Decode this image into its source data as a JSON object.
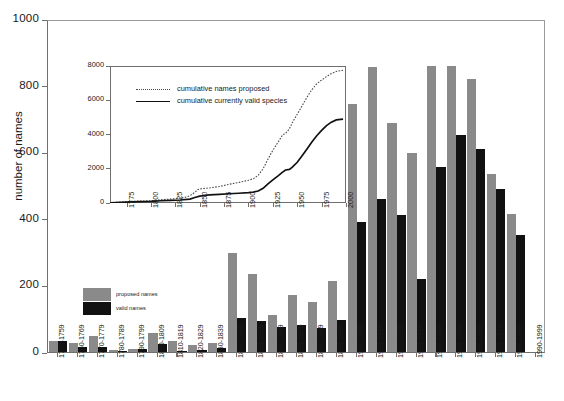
{
  "chart_data": {
    "type": "bar",
    "title": "",
    "xlabel": "",
    "ylabel": "number of names",
    "ylim": [
      0,
      1000
    ],
    "yticks": [
      0,
      200,
      400,
      600,
      800,
      1000
    ],
    "grid": false,
    "legend_position": "inside-left",
    "categories": [
      "1750-1759",
      "1760-1769",
      "1770-1779",
      "1780-1789",
      "1790-1799",
      "1800-1809",
      "1810-1819",
      "1820-1829",
      "1830-1839",
      "1840-1849",
      "1850-1859",
      "1860-1869",
      "1870-1879",
      "1880-1889",
      "1890-1899",
      "1900-1909",
      "1910-1919",
      "1920-1929",
      "1930-1939",
      "1940-1949",
      "1950-1959",
      "1960-1969",
      "1970-1979",
      "1980-1989",
      "1990-1999"
    ],
    "series": [
      {
        "name": "proposed names",
        "color": "#8a8a8a",
        "values": [
          32,
          26,
          48,
          7,
          9,
          56,
          34,
          22,
          26,
          297,
          233,
          110,
          172,
          151,
          213,
          744,
          855,
          688,
          598,
          860,
          860,
          820,
          536,
          415,
          0
        ]
      },
      {
        "name": "valid names",
        "color": "#111111",
        "values": [
          34,
          15,
          14,
          3,
          10,
          24,
          4,
          6,
          12,
          101,
          94,
          76,
          82,
          71,
          96,
          389,
          460,
          411,
          219,
          556,
          651,
          610,
          490,
          352,
          0
        ]
      }
    ],
    "inset": {
      "type": "line",
      "xlabel": "",
      "ylabel": "",
      "xlim": [
        1758,
        2000
      ],
      "ylim": [
        0,
        8000
      ],
      "yticks": [
        0,
        2000,
        4000,
        6000,
        8000
      ],
      "xticks": [
        1775,
        1800,
        1825,
        1850,
        1875,
        1900,
        1925,
        1950,
        1975,
        2000
      ],
      "series": [
        {
          "name": "cumulative names proposed",
          "style": "dotted",
          "color": "#4a4a4a",
          "points": [
            [
              1758,
              20
            ],
            [
              1770,
              55
            ],
            [
              1780,
              100
            ],
            [
              1790,
              115
            ],
            [
              1800,
              130
            ],
            [
              1810,
              190
            ],
            [
              1820,
              230
            ],
            [
              1825,
              255
            ],
            [
              1830,
              285
            ],
            [
              1835,
              330
            ],
            [
              1840,
              430
            ],
            [
              1845,
              620
            ],
            [
              1848,
              780
            ],
            [
              1852,
              840
            ],
            [
              1860,
              880
            ],
            [
              1870,
              960
            ],
            [
              1880,
              1090
            ],
            [
              1890,
              1200
            ],
            [
              1900,
              1330
            ],
            [
              1905,
              1420
            ],
            [
              1910,
              1620
            ],
            [
              1915,
              2000
            ],
            [
              1920,
              2560
            ],
            [
              1925,
              3080
            ],
            [
              1930,
              3520
            ],
            [
              1935,
              3980
            ],
            [
              1938,
              4060
            ],
            [
              1942,
              4330
            ],
            [
              1945,
              4700
            ],
            [
              1950,
              5180
            ],
            [
              1955,
              5680
            ],
            [
              1960,
              6180
            ],
            [
              1965,
              6620
            ],
            [
              1970,
              6960
            ],
            [
              1975,
              7180
            ],
            [
              1980,
              7380
            ],
            [
              1985,
              7560
            ],
            [
              1990,
              7680
            ],
            [
              1997,
              7750
            ]
          ]
        },
        {
          "name": "cumulative currently valid species",
          "style": "solid",
          "color": "#111111",
          "points": [
            [
              1758,
              15
            ],
            [
              1770,
              40
            ],
            [
              1780,
              70
            ],
            [
              1790,
              85
            ],
            [
              1800,
              95
            ],
            [
              1810,
              130
            ],
            [
              1820,
              155
            ],
            [
              1830,
              175
            ],
            [
              1840,
              230
            ],
            [
              1845,
              320
            ],
            [
              1850,
              400
            ],
            [
              1855,
              440
            ],
            [
              1860,
              470
            ],
            [
              1870,
              505
            ],
            [
              1880,
              540
            ],
            [
              1890,
              570
            ],
            [
              1900,
              610
            ],
            [
              1905,
              640
            ],
            [
              1910,
              700
            ],
            [
              1915,
              860
            ],
            [
              1920,
              1120
            ],
            [
              1925,
              1350
            ],
            [
              1930,
              1570
            ],
            [
              1935,
              1800
            ],
            [
              1938,
              1930
            ],
            [
              1942,
              1960
            ],
            [
              1945,
              2100
            ],
            [
              1950,
              2380
            ],
            [
              1955,
              2760
            ],
            [
              1960,
              3150
            ],
            [
              1965,
              3560
            ],
            [
              1970,
              3930
            ],
            [
              1975,
              4240
            ],
            [
              1980,
              4520
            ],
            [
              1985,
              4720
            ],
            [
              1990,
              4850
            ],
            [
              1997,
              4900
            ]
          ]
        }
      ]
    }
  }
}
